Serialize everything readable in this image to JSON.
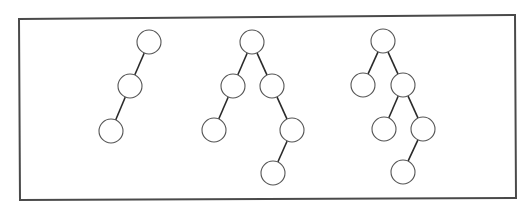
{
  "diagram": {
    "type": "binary-trees",
    "colors": {
      "frame": "#4a4a4a",
      "edge": "#2a2a2a",
      "node_stroke": "#555555",
      "node_fill": "#ffffff",
      "background": "#ffffff"
    },
    "frame": {
      "points": [
        [
          19,
          19
        ],
        [
          515,
          15
        ],
        [
          516,
          198
        ],
        [
          20,
          200
        ]
      ]
    },
    "node_radius": 12,
    "trees": [
      {
        "id": "tree-1",
        "nodes": [
          {
            "id": "t1-root",
            "x": 149,
            "y": 42
          },
          {
            "id": "t1-l",
            "x": 130,
            "y": 86
          },
          {
            "id": "t1-ll",
            "x": 111,
            "y": 131
          }
        ],
        "edges": [
          [
            "t1-root",
            "t1-l"
          ],
          [
            "t1-l",
            "t1-ll"
          ]
        ]
      },
      {
        "id": "tree-2",
        "nodes": [
          {
            "id": "t2-root",
            "x": 252,
            "y": 42
          },
          {
            "id": "t2-l",
            "x": 233,
            "y": 86
          },
          {
            "id": "t2-r",
            "x": 272,
            "y": 86
          },
          {
            "id": "t2-ll",
            "x": 214,
            "y": 130
          },
          {
            "id": "t2-rr",
            "x": 292,
            "y": 130
          },
          {
            "id": "t2-rrl",
            "x": 273,
            "y": 173
          }
        ],
        "edges": [
          [
            "t2-root",
            "t2-l"
          ],
          [
            "t2-root",
            "t2-r"
          ],
          [
            "t2-l",
            "t2-ll"
          ],
          [
            "t2-r",
            "t2-rr"
          ],
          [
            "t2-rr",
            "t2-rrl"
          ]
        ]
      },
      {
        "id": "tree-3",
        "nodes": [
          {
            "id": "t3-root",
            "x": 383,
            "y": 41
          },
          {
            "id": "t3-l",
            "x": 363,
            "y": 85
          },
          {
            "id": "t3-r",
            "x": 403,
            "y": 85
          },
          {
            "id": "t3-rl",
            "x": 384,
            "y": 129
          },
          {
            "id": "t3-rr",
            "x": 423,
            "y": 129
          },
          {
            "id": "t3-rrl",
            "x": 403,
            "y": 172
          }
        ],
        "edges": [
          [
            "t3-root",
            "t3-l"
          ],
          [
            "t3-root",
            "t3-r"
          ],
          [
            "t3-r",
            "t3-rl"
          ],
          [
            "t3-r",
            "t3-rr"
          ],
          [
            "t3-rr",
            "t3-rrl"
          ]
        ]
      }
    ]
  }
}
